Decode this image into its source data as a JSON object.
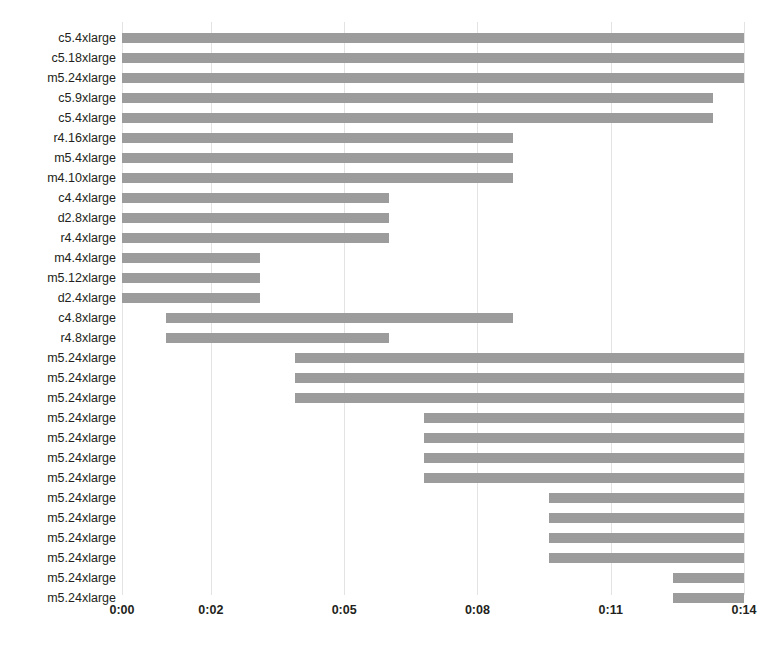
{
  "chart_data": {
    "type": "bar",
    "subtype": "gantt-range-bar",
    "title": "",
    "subtitle": "",
    "xlabel": "",
    "ylabel": "",
    "orientation": "horizontal",
    "grid": true,
    "grid_axis": "x",
    "legend": null,
    "bar_color": "#9c9c9c",
    "grid_color": "#e3e3e3",
    "text_color": "#231f20",
    "background": "#ffffff",
    "xlim": [
      0,
      14
    ],
    "x_unit": "minutes (m:ss displayed as h:mm)",
    "x_tick_values": [
      0,
      2,
      5,
      8,
      11,
      14
    ],
    "x_tick_labels": [
      "0:00",
      "0:02",
      "0:05",
      "0:08",
      "0:11",
      "0:14"
    ],
    "categories": [
      "c5.4xlarge",
      "c5.18xlarge",
      "m5.24xlarge",
      "c5.9xlarge",
      "c5.4xlarge",
      "r4.16xlarge",
      "m5.4xlarge",
      "m4.10xlarge",
      "c4.4xlarge",
      "d2.8xlarge",
      "r4.4xlarge",
      "m4.4xlarge",
      "m5.12xlarge",
      "d2.4xlarge",
      "c4.8xlarge",
      "r4.8xlarge",
      "m5.24xlarge",
      "m5.24xlarge",
      "m5.24xlarge",
      "m5.24xlarge",
      "m5.24xlarge",
      "m5.24xlarge",
      "m5.24xlarge",
      "m5.24xlarge",
      "m5.24xlarge",
      "m5.24xlarge",
      "m5.24xlarge",
      "m5.24xlarge",
      "m5.24xlarge"
    ],
    "bars": [
      {
        "label": "c5.4xlarge",
        "start": 0.0,
        "end": 14.0,
        "duration": 14.0
      },
      {
        "label": "c5.18xlarge",
        "start": 0.0,
        "end": 14.0,
        "duration": 14.0
      },
      {
        "label": "m5.24xlarge",
        "start": 0.0,
        "end": 14.0,
        "duration": 14.0
      },
      {
        "label": "c5.9xlarge",
        "start": 0.0,
        "end": 13.3,
        "duration": 13.3
      },
      {
        "label": "c5.4xlarge",
        "start": 0.0,
        "end": 13.3,
        "duration": 13.3
      },
      {
        "label": "r4.16xlarge",
        "start": 0.0,
        "end": 8.8,
        "duration": 8.8
      },
      {
        "label": "m5.4xlarge",
        "start": 0.0,
        "end": 8.8,
        "duration": 8.8
      },
      {
        "label": "m4.10xlarge",
        "start": 0.0,
        "end": 8.8,
        "duration": 8.8
      },
      {
        "label": "c4.4xlarge",
        "start": 0.0,
        "end": 6.0,
        "duration": 6.0
      },
      {
        "label": "d2.8xlarge",
        "start": 0.0,
        "end": 6.0,
        "duration": 6.0
      },
      {
        "label": "r4.4xlarge",
        "start": 0.0,
        "end": 6.0,
        "duration": 6.0
      },
      {
        "label": "m4.4xlarge",
        "start": 0.0,
        "end": 3.1,
        "duration": 3.1
      },
      {
        "label": "m5.12xlarge",
        "start": 0.0,
        "end": 3.1,
        "duration": 3.1
      },
      {
        "label": "d2.4xlarge",
        "start": 0.0,
        "end": 3.1,
        "duration": 3.1
      },
      {
        "label": "c4.8xlarge",
        "start": 1.0,
        "end": 8.8,
        "duration": 7.8
      },
      {
        "label": "r4.8xlarge",
        "start": 1.0,
        "end": 6.0,
        "duration": 5.0
      },
      {
        "label": "m5.24xlarge",
        "start": 3.9,
        "end": 14.0,
        "duration": 10.1
      },
      {
        "label": "m5.24xlarge",
        "start": 3.9,
        "end": 14.0,
        "duration": 10.1
      },
      {
        "label": "m5.24xlarge",
        "start": 3.9,
        "end": 14.0,
        "duration": 10.1
      },
      {
        "label": "m5.24xlarge",
        "start": 6.8,
        "end": 14.0,
        "duration": 7.2
      },
      {
        "label": "m5.24xlarge",
        "start": 6.8,
        "end": 14.0,
        "duration": 7.2
      },
      {
        "label": "m5.24xlarge",
        "start": 6.8,
        "end": 14.0,
        "duration": 7.2
      },
      {
        "label": "m5.24xlarge",
        "start": 6.8,
        "end": 14.0,
        "duration": 7.2
      },
      {
        "label": "m5.24xlarge",
        "start": 9.6,
        "end": 14.0,
        "duration": 4.4
      },
      {
        "label": "m5.24xlarge",
        "start": 9.6,
        "end": 14.0,
        "duration": 4.4
      },
      {
        "label": "m5.24xlarge",
        "start": 9.6,
        "end": 14.0,
        "duration": 4.4
      },
      {
        "label": "m5.24xlarge",
        "start": 9.6,
        "end": 14.0,
        "duration": 4.4
      },
      {
        "label": "m5.24xlarge",
        "start": 12.4,
        "end": 14.0,
        "duration": 1.6
      },
      {
        "label": "m5.24xlarge",
        "start": 12.4,
        "end": 14.0,
        "duration": 1.6
      }
    ]
  }
}
